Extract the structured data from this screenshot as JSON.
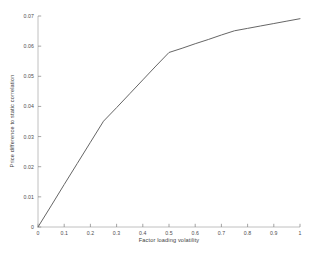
{
  "chart_data": {
    "type": "line",
    "title": "",
    "xlabel": "Factor loading volatility",
    "ylabel": "Price difference to static correlation",
    "xlim": [
      0,
      1
    ],
    "ylim": [
      0,
      0.07
    ],
    "grid": false,
    "legend": null,
    "xticks": [
      "0",
      "0.1",
      "0.2",
      "0.3",
      "0.4",
      "0.5",
      "0.6",
      "0.7",
      "0.8",
      "0.9",
      "1"
    ],
    "xtick_values": [
      0,
      0.1,
      0.2,
      0.3,
      0.4,
      0.5,
      0.6,
      0.7,
      0.8,
      0.9,
      1
    ],
    "yticks": [
      "0",
      "0.01",
      "0.02",
      "0.03",
      "0.04",
      "0.05",
      "0.06",
      "0.07"
    ],
    "ytick_values": [
      0,
      0.01,
      0.02,
      0.03,
      0.04,
      0.05,
      0.06,
      0.07
    ],
    "series": [
      {
        "name": "Price difference to static correlation",
        "color": "#666666",
        "linewidth": 1.0,
        "x": [
          0,
          0.05,
          0.1,
          0.15,
          0.2,
          0.25,
          0.3,
          0.35,
          0.4,
          0.45,
          0.5,
          0.55,
          0.6,
          0.65,
          0.7,
          0.75,
          0.8,
          0.85,
          0.9,
          0.95,
          1
        ],
        "y": [
          0.0,
          0.007,
          0.0141,
          0.0211,
          0.0281,
          0.0351,
          0.0396,
          0.0442,
          0.0488,
          0.0534,
          0.0579,
          0.0593,
          0.0608,
          0.0622,
          0.0637,
          0.0651,
          0.0659,
          0.0667,
          0.0675,
          0.0683,
          0.0691
        ]
      }
    ]
  },
  "axes": {
    "axis_color": "#b0b0b0",
    "tick_color": "#808080",
    "background": "#ffffff"
  }
}
